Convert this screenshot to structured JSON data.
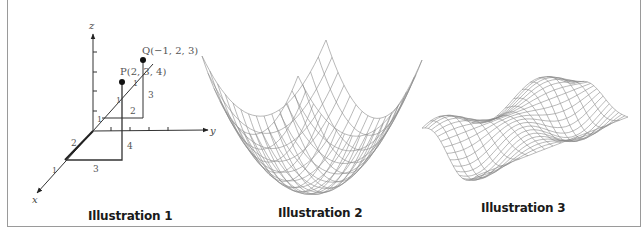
{
  "illustrations": [
    {
      "caption": "Illustration 1",
      "title": "3D coordinate system with points",
      "axes": {
        "x": "x",
        "y": "y",
        "z": "z"
      },
      "points": [
        {
          "label": "P(2, 3, 4)",
          "coords": [
            2,
            3,
            4
          ]
        },
        {
          "label": "Q(−1, 2, 3)",
          "coords": [
            -1,
            2,
            3
          ]
        }
      ],
      "tick_labels": [
        "1",
        "1",
        "2",
        "1",
        "1",
        "1"
      ],
      "dimension_labels": {
        "p_z": "4",
        "p_y": "3",
        "q_z": "3",
        "q_y": "2"
      }
    },
    {
      "caption": "Illustration 2",
      "title": "Paraboloid wireframe surface"
    },
    {
      "caption": "Illustration 3",
      "title": "Sinusoidal wave wireframe surface"
    }
  ],
  "colors": {
    "frame": "#9a9a9a",
    "axes": "#333333",
    "mesh": "#8a8a8a",
    "label": "#555555"
  }
}
